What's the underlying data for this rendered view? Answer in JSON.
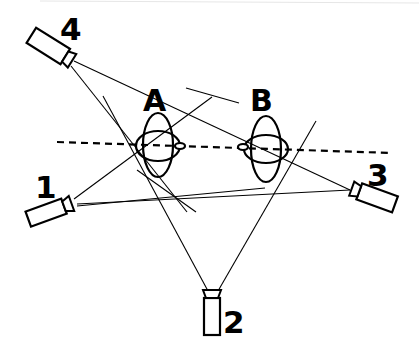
{
  "diagram": {
    "type": "multi-camera-setup",
    "colors": {
      "ink": "#000000",
      "background": "#ffffff"
    },
    "cameras": [
      {
        "id": "cam1",
        "label": "1"
      },
      {
        "id": "cam2",
        "label": "2"
      },
      {
        "id": "cam3",
        "label": "3"
      },
      {
        "id": "cam4",
        "label": "4"
      }
    ],
    "objects": [
      {
        "id": "objA",
        "label": "A"
      },
      {
        "id": "objB",
        "label": "B"
      }
    ],
    "axis": {
      "style": "dashed",
      "description": "line of action through A and B"
    }
  }
}
